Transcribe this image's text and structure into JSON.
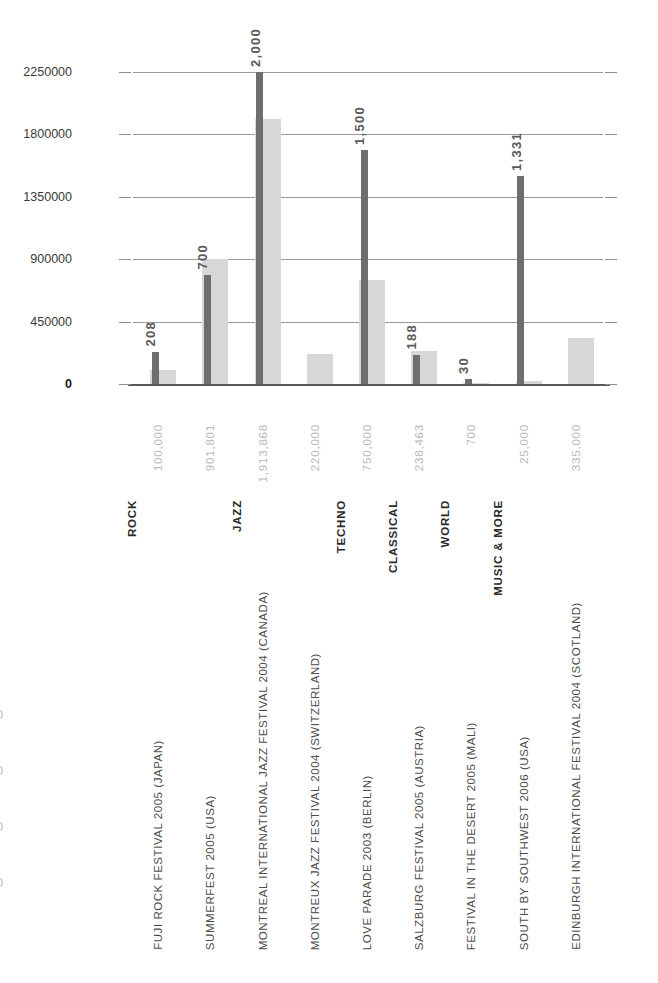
{
  "chart_data": {
    "type": "bar",
    "title": "",
    "subtitle": "",
    "xlabel": "",
    "grid": true,
    "legend_position": "none",
    "axes": {
      "left": {
        "label": "",
        "ticks": [
          "0",
          "450000",
          "900000",
          "1350000",
          "1800000",
          "2250000"
        ],
        "tick_values": [
          0,
          450000,
          900000,
          1350000,
          1800000,
          2250000
        ],
        "ylim": [
          0,
          2250000
        ],
        "color": "#3a3a3a"
      },
      "right": {
        "label": "",
        "ticks": [
          "0",
          "400",
          "800",
          "1200",
          "1600",
          "2000"
        ],
        "tick_values": [
          0,
          400,
          800,
          1200,
          1600,
          2000
        ],
        "ylim": [
          0,
          2000
        ],
        "color": "#8d8d8d"
      }
    },
    "categories": [
      "FUJI ROCK FESTIVAL 2005 (JAPAN)",
      "SUMMERFEST 2005 (USA)",
      "MONTREAL INTERNATIONAL JAZZ FESTIVAL 2004 (CANADA)",
      "MONTREUX JAZZ FESTIVAL 2004 (SWITZERLAND)",
      "LOVE PARADE 2003 (BERLIN)",
      "SALZBURG FESTIVAL 2005 (AUSTRIA)",
      "FESTIVAL IN THE DESERT 2005 (MALI)",
      "SOUTH BY SOUTHWEST 2006 (USA)",
      "EDINBURGH INTERNATIONAL FESTIVAL 2004 (SCOTLAND)"
    ],
    "genres": [
      {
        "label": "ROCK",
        "span": [
          0,
          1
        ]
      },
      {
        "label": "JAZZ",
        "span": [
          2,
          3
        ]
      },
      {
        "label": "TECHNO",
        "span": [
          4,
          4
        ]
      },
      {
        "label": "CLASSICAL",
        "span": [
          5,
          5
        ]
      },
      {
        "label": "WORLD",
        "span": [
          6,
          6
        ]
      },
      {
        "label": "MUSIC & MORE",
        "span": [
          7,
          8
        ]
      }
    ],
    "series": [
      {
        "name": "attendance",
        "axis": "left",
        "color": "#d7d7d7",
        "values": [
          100000,
          901801,
          1913868,
          220000,
          750000,
          238463,
          700,
          25000,
          335000
        ],
        "labels": [
          "100,000",
          "901,801",
          "1,913,868",
          "220,000",
          "750,000",
          "238,463",
          "700",
          "25,000",
          "335,000"
        ]
      },
      {
        "name": "price",
        "axis": "right",
        "color": "#6e6e6e",
        "values": [
          208,
          700,
          2000,
          null,
          1500,
          188,
          30,
          1331,
          null
        ],
        "labels": [
          "208",
          "700",
          "2,000",
          "",
          "1,500",
          "188",
          "30",
          "1,331",
          ""
        ]
      }
    ]
  },
  "edge_fragments": [
    "0",
    "0",
    "0",
    "0"
  ]
}
